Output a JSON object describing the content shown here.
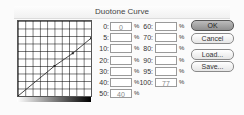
{
  "dialog": {
    "title": "Duotone Curve"
  },
  "curve": {
    "points": [
      {
        "input": 0,
        "output": 0
      },
      {
        "input": 50,
        "output": 40
      },
      {
        "input": 75,
        "output": 57
      },
      {
        "input": 100,
        "output": 77
      }
    ]
  },
  "fields_left": [
    {
      "label": "0:",
      "value": "0"
    },
    {
      "label": "5:",
      "value": ""
    },
    {
      "label": "10:",
      "value": ""
    },
    {
      "label": "20:",
      "value": ""
    },
    {
      "label": "30:",
      "value": ""
    },
    {
      "label": "40:",
      "value": ""
    },
    {
      "label": "50:",
      "value": "40"
    }
  ],
  "fields_right": [
    {
      "label": "60:",
      "value": ""
    },
    {
      "label": "70:",
      "value": ""
    },
    {
      "label": "80:",
      "value": ""
    },
    {
      "label": "90:",
      "value": ""
    },
    {
      "label": "95:",
      "value": ""
    },
    {
      "label": "100:",
      "value": "77"
    }
  ],
  "percent_sign": "%",
  "buttons": {
    "ok": "OK",
    "cancel": "Cancel",
    "load": "Load...",
    "save": "Save..."
  }
}
